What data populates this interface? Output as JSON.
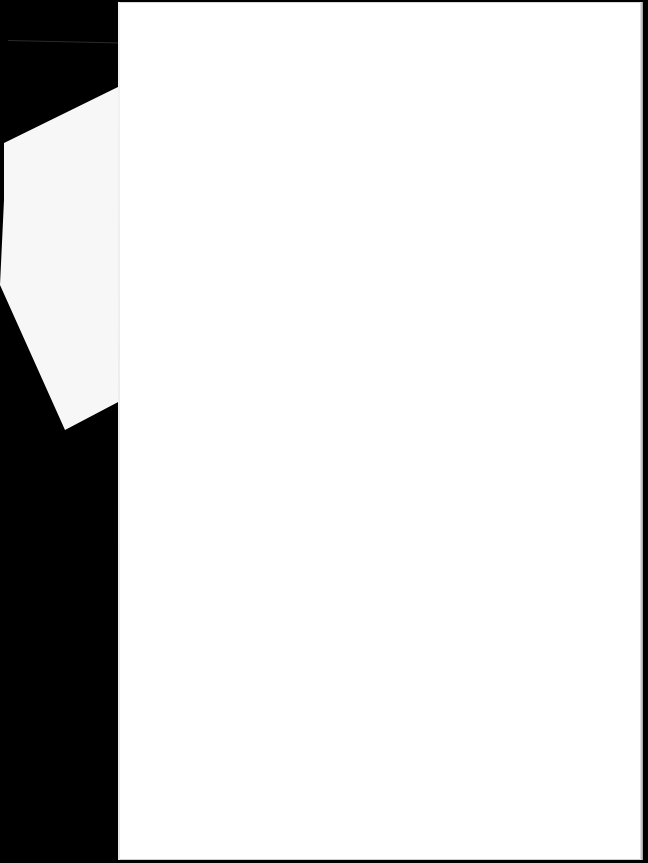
{
  "scene": {
    "background_color": "#000000",
    "description": "Scanned blank sheet of paper on a black background"
  },
  "main_page": {
    "color": "#ffffff",
    "text": ""
  },
  "back_fragment": {
    "color": "#f7f7f7",
    "text": ""
  }
}
